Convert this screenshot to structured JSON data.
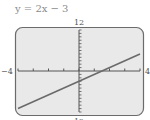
{
  "chart_data": {
    "type": "line",
    "title": "y = 2x − 3",
    "equation": {
      "slope": 2,
      "intercept": -3
    },
    "xlim": [
      -4,
      4
    ],
    "ylim": [
      -12,
      12
    ],
    "x_tick_step": 1,
    "y_tick_step": 1,
    "axis_labels": {
      "xmin": "−4",
      "xmax": "4",
      "ymax": "12",
      "ymin": "12"
    },
    "series": [
      {
        "name": "y = 2x − 3",
        "x": [
          -4,
          4
        ],
        "y": [
          -11,
          5
        ]
      }
    ],
    "grid": false,
    "colors": {
      "screen_bg": "#e9e9e9",
      "frame": "#6b6b6b",
      "axis": "#555555",
      "line": "#6a6a6a"
    }
  }
}
